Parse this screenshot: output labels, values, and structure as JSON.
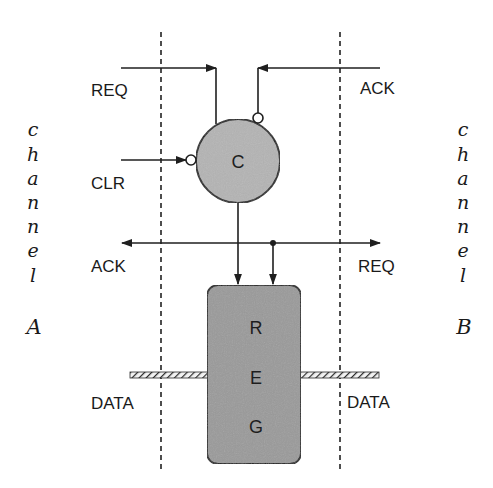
{
  "diagram": {
    "type": "handshake-latch-controller",
    "colors": {
      "wire": "#1f1f1f",
      "c_element_fill": "#b4b4b4",
      "register_fill": "#9a9a9a",
      "background": "#ffffff"
    },
    "channel_a": {
      "letters": [
        "c",
        "h",
        "a",
        "n",
        "n",
        "e",
        "l"
      ],
      "id": "A"
    },
    "channel_b": {
      "letters": [
        "c",
        "h",
        "a",
        "n",
        "n",
        "e",
        "l"
      ],
      "id": "B"
    },
    "left_signals": {
      "req": "REQ",
      "clr": "CLR",
      "ack": "ACK",
      "data": "DATA"
    },
    "right_signals": {
      "ack": "ACK",
      "req": "REQ",
      "data": "DATA"
    },
    "c_element": {
      "label": "C"
    },
    "register": {
      "letters": [
        "R",
        "E",
        "G"
      ]
    }
  }
}
